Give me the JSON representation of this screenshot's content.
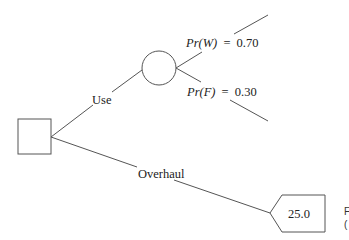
{
  "diagram": {
    "type": "decision-tree",
    "colors": {
      "line": "#555555",
      "text": "#222222",
      "background": "#ffffff"
    },
    "decision_node": {
      "shape": "square"
    },
    "branches": {
      "use": {
        "label": "Use"
      },
      "overhaul": {
        "label": "Overhaul"
      }
    },
    "chance_node": {
      "shape": "circle",
      "outcomes": [
        {
          "event_symbol": "Pr(W)",
          "equals": "=",
          "probability": "0.70"
        },
        {
          "event_symbol": "Pr(F)",
          "equals": "=",
          "probability": "0.30"
        }
      ]
    },
    "terminal_node": {
      "shape": "pentagon",
      "value": "25.0"
    },
    "cropped_side_text": [
      "F",
      "("
    ]
  }
}
